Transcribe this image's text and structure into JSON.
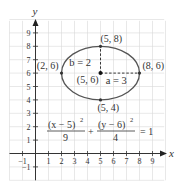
{
  "chart_data": {
    "type": "line",
    "title": "",
    "xlabel": "x",
    "ylabel": "y",
    "xlim": [
      -2,
      10
    ],
    "ylim": [
      -2,
      10
    ],
    "grid": true,
    "x_ticks": [
      -1,
      1,
      2,
      3,
      4,
      5,
      6,
      7,
      8,
      9
    ],
    "x_tick_labels": [
      "−1",
      "1",
      "2",
      "3",
      "4",
      "5",
      "6",
      "7",
      "8",
      "9"
    ],
    "y_ticks": [
      -1,
      1,
      2,
      3,
      4,
      5,
      6,
      7,
      8,
      9
    ],
    "y_tick_labels": [
      "−1",
      "1",
      "2",
      "3",
      "4",
      "5",
      "6",
      "7",
      "8",
      "9"
    ],
    "ellipse": {
      "center": [
        5,
        6
      ],
      "a": 3,
      "b": 2,
      "orientation": "horizontal"
    },
    "points": [
      {
        "x": 2,
        "y": 6,
        "label": "(2, 6)"
      },
      {
        "x": 8,
        "y": 6,
        "label": "(8, 6)"
      },
      {
        "x": 5,
        "y": 8,
        "label": "(5, 8)"
      },
      {
        "x": 5,
        "y": 4,
        "label": "(5, 4)"
      },
      {
        "x": 5,
        "y": 6,
        "label": "(5, 6)",
        "center": true
      }
    ],
    "segments": [
      {
        "from": [
          5,
          6
        ],
        "to": [
          8,
          6
        ],
        "style": "dashed",
        "label": "a = 3"
      },
      {
        "from": [
          5,
          6
        ],
        "to": [
          5,
          8
        ],
        "style": "dashed",
        "label": "b = 2"
      }
    ],
    "annotations": {
      "a_label": "a = 3",
      "b_label": "b = 2",
      "equation": {
        "num1": "(x − 5)",
        "num1_exp": "2",
        "den1": "9",
        "plus": "+",
        "num2": "(y − 6)",
        "num2_exp": "2",
        "den2": "4",
        "rhs": "= 1"
      }
    }
  }
}
